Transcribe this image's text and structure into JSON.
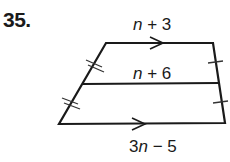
{
  "problem": {
    "number": "35.",
    "top_base": "n + 3",
    "midsegment": "n + 6",
    "bottom_base": "3n − 5"
  },
  "figure": {
    "shape": "trapezoid",
    "markings": [
      "parallel-arrow-top",
      "parallel-arrow-bottom",
      "double-tick-left-upper",
      "double-tick-left-lower",
      "single-tick-right-upper",
      "single-tick-right-lower"
    ]
  }
}
